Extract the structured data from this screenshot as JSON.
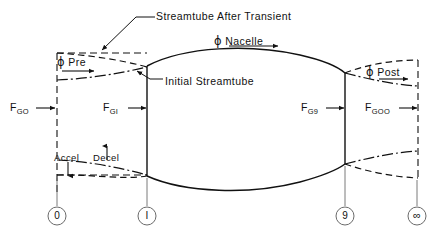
{
  "diagram": {
    "title_annotations": [
      {
        "id": "streamtube-after-transient",
        "text": "Streamtube After Transient",
        "x": 156,
        "y": 8
      },
      {
        "id": "initial-streamtube",
        "text": "Initial Streamtube",
        "x": 165,
        "y": 74
      }
    ],
    "flow_labels": [
      {
        "id": "phi-pre",
        "symbol": "ϕ",
        "text": "Pre",
        "x": 57,
        "y": 55
      },
      {
        "id": "phi-nacelle",
        "symbol": "ϕ",
        "text": "Nacelle",
        "x": 214,
        "y": 36
      },
      {
        "id": "phi-post",
        "symbol": "ϕ",
        "text": "Post",
        "x": 366,
        "y": 66
      }
    ],
    "force_labels": [
      {
        "id": "f-g0",
        "base": "F",
        "subscript": "GO",
        "x": 10,
        "y": 102
      },
      {
        "id": "f-g1",
        "base": "F",
        "subscript": "GI",
        "x": 103,
        "y": 102
      },
      {
        "id": "f-g9",
        "base": "F",
        "subscript": "G9",
        "x": 301,
        "y": 102
      },
      {
        "id": "f-goo",
        "base": "F",
        "subscript": "GOO",
        "x": 365,
        "y": 102
      }
    ],
    "region_labels": [
      {
        "id": "accel",
        "text": "Accel",
        "x": 55,
        "y": 152
      },
      {
        "id": "decel",
        "text": "Decel",
        "x": 94,
        "y": 152
      }
    ],
    "stations": [
      {
        "id": "station-0",
        "label": "0",
        "cx": 57,
        "cy": 216
      },
      {
        "id": "station-1",
        "label": "I",
        "cx": 147,
        "cy": 216
      },
      {
        "id": "station-9",
        "label": "9",
        "cx": 345,
        "cy": 216
      },
      {
        "id": "station-infinity",
        "label": "∞",
        "cx": 417,
        "cy": 216
      }
    ],
    "colors": {
      "line": "#111111",
      "background": "#ffffff",
      "text": "#111111"
    }
  }
}
